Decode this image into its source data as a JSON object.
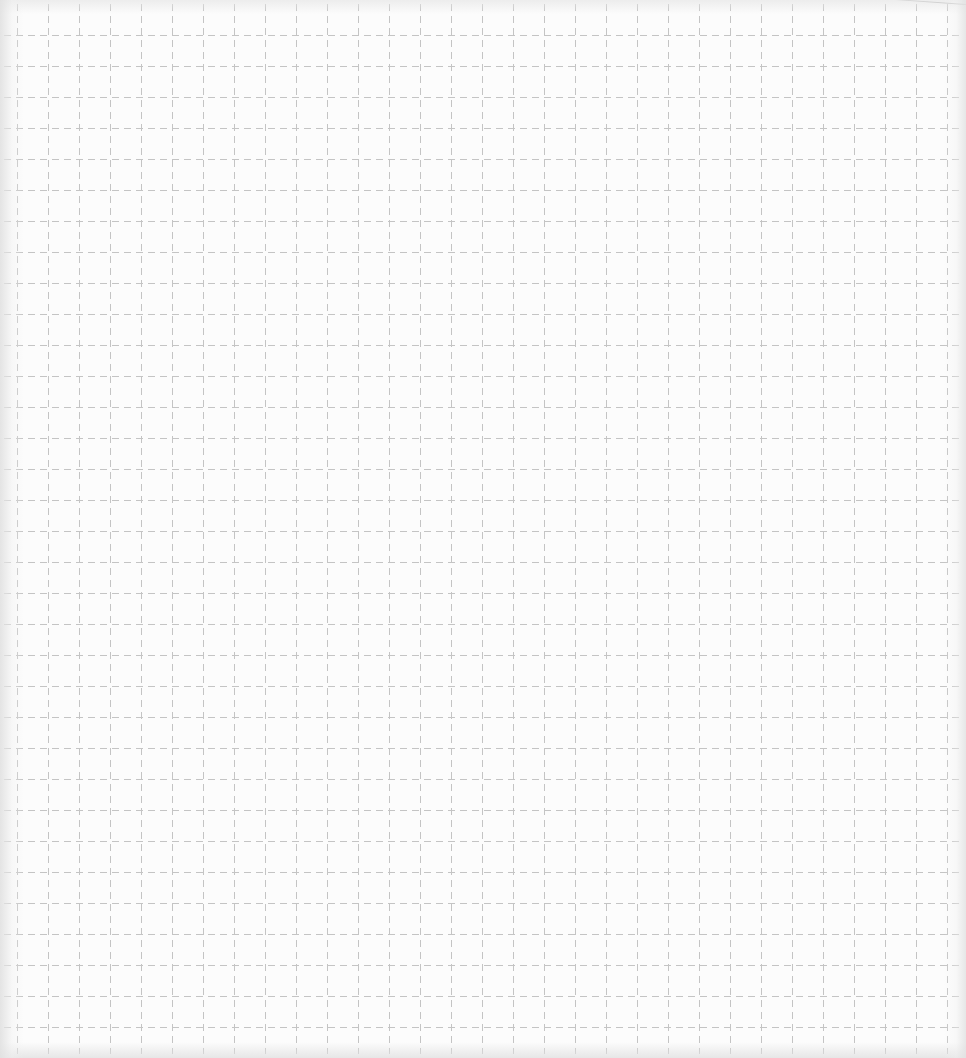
{
  "sheet": {
    "kind": "dashed grid paper",
    "background_color": "#fcfcfc",
    "grid": {
      "line_color": "#c4c4c4",
      "spacing_px": 31,
      "origin_x": 17,
      "origin_y": 35,
      "columns": 31,
      "rows": 33,
      "dash_pattern": "7 5"
    }
  }
}
